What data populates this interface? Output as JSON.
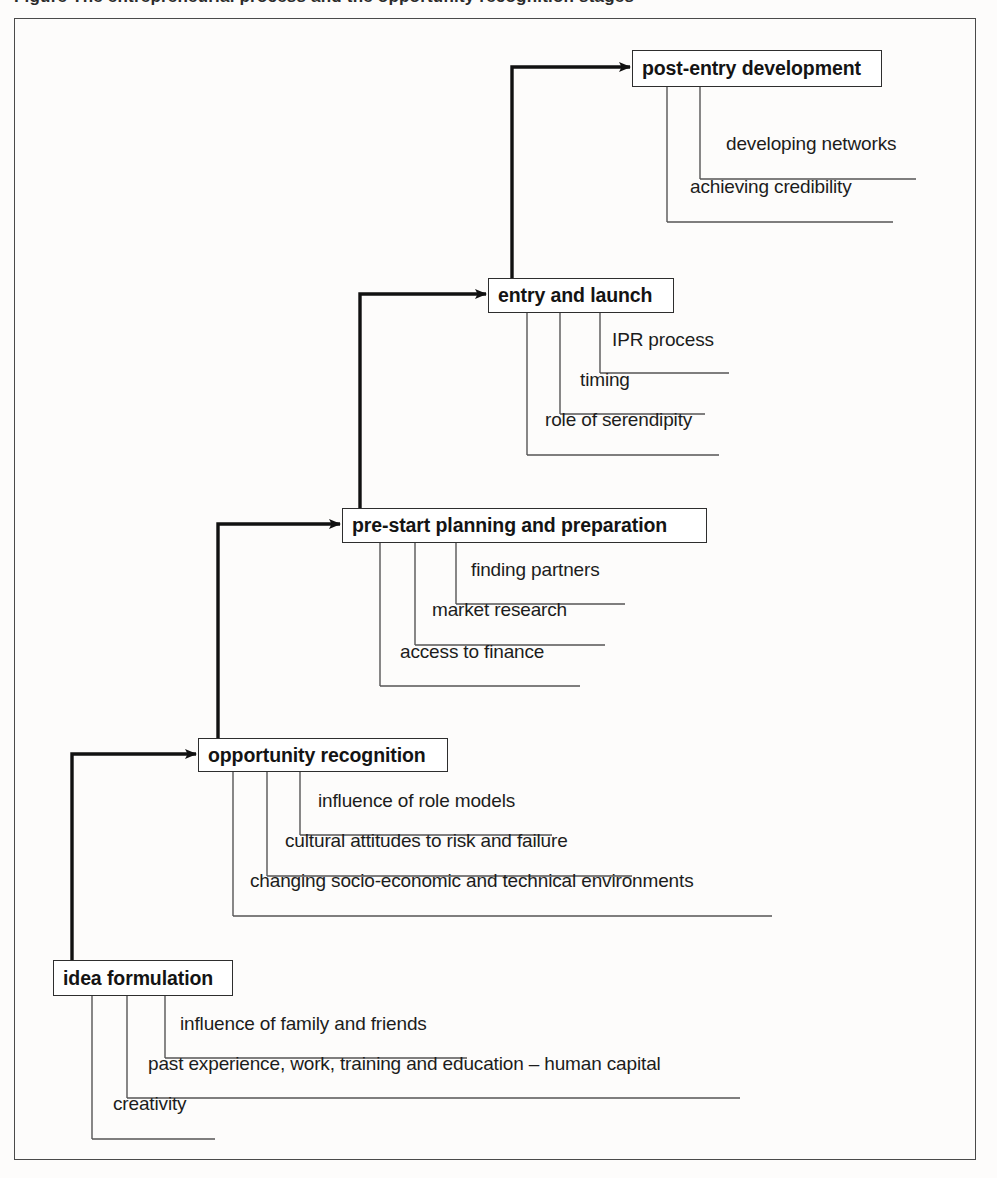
{
  "caption": "Figure   The entrepreneurial process and the opportunity recognition stages",
  "diagram": {
    "type": "cascade-staircase",
    "orientation": "bottom-left to top-right",
    "arrow_style": "elbow arrow from top of lower stage box, up then right into left edge of next stage box",
    "sub_item_style": "vertical drop line from box underside, then horizontal rule underneath label text",
    "colors": {
      "box_border": "#2e2e2e",
      "frame_border": "#4a4a4a",
      "arrow": "#111111",
      "leader_line": "#555555",
      "text": "#141414",
      "background": "#fdfcfb"
    },
    "stages": [
      {
        "id": "post-entry-development",
        "label": "post-entry development",
        "order": 5,
        "box": {
          "x": 632,
          "y": 50,
          "w": 250,
          "h": 37
        },
        "sub_items": [
          {
            "label": "developing networks",
            "drop_x": 700,
            "text_x": 726,
            "text_y": 149,
            "rule_y": 179,
            "rule_x2": 916
          },
          {
            "label": "achieving credibility",
            "drop_x": 667,
            "text_x": 690,
            "text_y": 192,
            "rule_y": 222,
            "rule_x2": 893
          }
        ]
      },
      {
        "id": "entry-and-launch",
        "label": "entry and launch",
        "order": 4,
        "box": {
          "x": 488,
          "y": 278,
          "w": 186,
          "h": 35
        },
        "sub_items": [
          {
            "label": "IPR process",
            "drop_x": 600,
            "text_x": 612,
            "text_y": 345,
            "rule_y": 373,
            "rule_x2": 729
          },
          {
            "label": "timing",
            "drop_x": 560,
            "text_x": 580,
            "text_y": 385,
            "rule_y": 414,
            "rule_x2": 705
          },
          {
            "label": "role of serendipity",
            "drop_x": 527,
            "text_x": 545,
            "text_y": 425,
            "rule_y": 455,
            "rule_x2": 719
          }
        ]
      },
      {
        "id": "pre-start-planning-and-preparation",
        "label": "pre-start planning and preparation",
        "order": 3,
        "box": {
          "x": 342,
          "y": 508,
          "w": 365,
          "h": 35
        },
        "sub_items": [
          {
            "label": "finding partners",
            "drop_x": 456,
            "text_x": 471,
            "text_y": 575,
            "rule_y": 604,
            "rule_x2": 625
          },
          {
            "label": "market research",
            "drop_x": 415,
            "text_x": 432,
            "text_y": 615,
            "rule_y": 645,
            "rule_x2": 605
          },
          {
            "label": "access to finance",
            "drop_x": 380,
            "text_x": 400,
            "text_y": 657,
            "rule_y": 686,
            "rule_x2": 580
          }
        ]
      },
      {
        "id": "opportunity-recognition",
        "label": "opportunity recognition",
        "order": 2,
        "box": {
          "x": 198,
          "y": 738,
          "w": 250,
          "h": 34
        },
        "sub_items": [
          {
            "label": "influence of role models",
            "drop_x": 300,
            "text_x": 318,
            "text_y": 806,
            "rule_y": 835,
            "rule_x2": 552
          },
          {
            "label": "cultural attitudes to risk and failure",
            "drop_x": 267,
            "text_x": 285,
            "text_y": 846,
            "rule_y": 876,
            "rule_x2": 632
          },
          {
            "label": "changing socio-economic and technical environments",
            "drop_x": 233,
            "text_x": 250,
            "text_y": 886,
            "rule_y": 916,
            "rule_x2": 772
          }
        ]
      },
      {
        "id": "idea-formulation",
        "label": "idea formulation",
        "order": 1,
        "box": {
          "x": 53,
          "y": 960,
          "w": 180,
          "h": 36
        },
        "sub_items": [
          {
            "label": "influence of family and friends",
            "drop_x": 165,
            "text_x": 180,
            "text_y": 1029,
            "rule_y": 1058,
            "rule_x2": 467
          },
          {
            "label": "past experience, work, training and education – human capital",
            "drop_x": 127,
            "text_x": 148,
            "text_y": 1069,
            "rule_y": 1098,
            "rule_x2": 740
          },
          {
            "label": "creativity",
            "drop_x": 92,
            "text_x": 113,
            "text_y": 1109,
            "rule_y": 1139,
            "rule_x2": 215
          }
        ]
      }
    ],
    "arrows": [
      {
        "from": "idea-formulation",
        "to": "opportunity-recognition",
        "up_x": 72,
        "from_y": 960,
        "turn_y": 754,
        "to_x": 196
      },
      {
        "from": "opportunity-recognition",
        "to": "pre-start-planning-and-preparation",
        "up_x": 218,
        "from_y": 738,
        "turn_y": 524,
        "to_x": 340
      },
      {
        "from": "pre-start-planning-and-preparation",
        "to": "entry-and-launch",
        "up_x": 360,
        "from_y": 508,
        "turn_y": 294,
        "to_x": 486
      },
      {
        "from": "entry-and-launch",
        "to": "post-entry-development",
        "up_x": 512,
        "from_y": 278,
        "turn_y": 67,
        "to_x": 630
      }
    ]
  }
}
